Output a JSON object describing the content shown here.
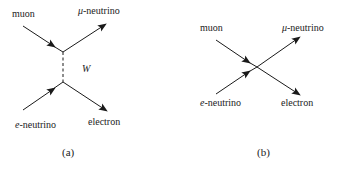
{
  "diagram_a": {
    "caption": "(a)",
    "particles": {
      "muon": "muon",
      "mu_neutrino_symbol": "μ",
      "mu_neutrino_suffix": "-neutrino",
      "e_neutrino_symbol": "e",
      "e_neutrino_suffix": "-neutrino",
      "electron": "electron"
    },
    "boson": "W"
  },
  "diagram_b": {
    "caption": "(b)",
    "particles": {
      "muon": "muon",
      "mu_neutrino_symbol": "μ",
      "mu_neutrino_suffix": "-neutrino",
      "e_neutrino_symbol": "e",
      "e_neutrino_suffix": "-neutrino",
      "electron": "electron"
    }
  },
  "colors": {
    "line": "#1a1a1a",
    "text": "#222222",
    "background": "#ffffff"
  }
}
